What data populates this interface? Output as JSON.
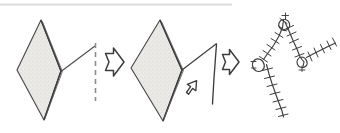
{
  "figure": {
    "title": "Paper folding to stitched net transformation sequence",
    "background_color": "#ffffff",
    "ink_color": "#3a3a3a",
    "ink_color_light": "#8a8a8a",
    "fill_color": "#e8e7e4",
    "top_rule_color": "#d8d8d8",
    "width": 340,
    "height": 133
  },
  "panels": [
    {
      "id": "panel-1",
      "name": "folded-diamond-with-crease-line",
      "label": "Folded diamond sheet with dashed crease reference line",
      "shape": "diamond",
      "shaded": true
    },
    {
      "id": "panel-2",
      "name": "diamond-with-opening-flap",
      "label": "Diamond sheet with flap being opened outward",
      "shape": "diamond",
      "shaded": true
    },
    {
      "id": "panel-3",
      "name": "stitched-net-graph",
      "label": "Stitched zigzag net with loop nodes",
      "shape": "stitched-network",
      "shaded": false
    }
  ],
  "arrows": [
    {
      "id": "arrow-1",
      "name": "transition-arrow-1",
      "direction": "right",
      "label": "leads to"
    },
    {
      "id": "arrow-2",
      "name": "transition-arrow-2",
      "direction": "right",
      "label": "leads to"
    },
    {
      "id": "arrow-3",
      "name": "flap-open-arrow",
      "direction": "up-left",
      "label": "open flap"
    }
  ],
  "annotations": {
    "crease_line": "dashed vertical crease line",
    "fold_edge": "double line fold edge on diamond right side",
    "flap_edge": "bent flap outline",
    "nodes": [
      "loop-node-top",
      "loop-node-left",
      "loop-node-right"
    ],
    "seams": [
      "seam-upper-left",
      "seam-upper-right",
      "seam-lower-left",
      "seam-right-branch"
    ]
  }
}
